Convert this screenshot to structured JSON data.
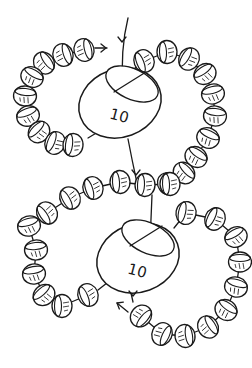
{
  "diagram": {
    "title": "",
    "background": "#ffffff",
    "line_color": "#1a1a1a",
    "big_beads": [
      {
        "label": "10",
        "cx": 120,
        "cy": 103,
        "rx": 42,
        "ry": 34,
        "rot": -20,
        "hole": {
          "cx": 132,
          "cy": 84,
          "rx": 28,
          "ry": 15,
          "rot": 25
        }
      },
      {
        "label": "10",
        "cx": 138,
        "cy": 258,
        "rx": 42,
        "ry": 34,
        "rot": -20,
        "hole": {
          "cx": 148,
          "cy": 238,
          "rx": 28,
          "ry": 15,
          "rot": 25
        }
      }
    ],
    "seed_bead_loops": [
      {
        "name": "upper-left-loop",
        "beads": [
          [
            84,
            50
          ],
          [
            63,
            55
          ],
          [
            44,
            63
          ],
          [
            32,
            77
          ],
          [
            25,
            96
          ],
          [
            28,
            116
          ],
          [
            39,
            132
          ],
          [
            55,
            143
          ],
          [
            73,
            145
          ]
        ]
      },
      {
        "name": "upper-right-loop",
        "beads": [
          [
            144,
            61
          ],
          [
            167,
            52
          ],
          [
            189,
            59
          ],
          [
            205,
            74
          ],
          [
            213,
            94
          ],
          [
            215,
            116
          ],
          [
            208,
            138
          ],
          [
            196,
            157
          ],
          [
            184,
            173
          ],
          [
            168,
            184
          ]
        ]
      },
      {
        "name": "middle-band",
        "beads": [
          [
            47,
            213
          ],
          [
            70,
            198
          ],
          [
            93,
            188
          ],
          [
            120,
            182
          ],
          [
            145,
            185
          ],
          [
            170,
            184
          ]
        ]
      },
      {
        "name": "lower-left-loop",
        "beads": [
          [
            29,
            226
          ],
          [
            36,
            250
          ],
          [
            34,
            274
          ],
          [
            44,
            295
          ],
          [
            62,
            306
          ],
          [
            88,
            295
          ]
        ]
      },
      {
        "name": "lower-right-loop",
        "beads": [
          [
            186,
            213
          ],
          [
            215,
            219
          ],
          [
            236,
            237
          ],
          [
            240,
            262
          ],
          [
            236,
            287
          ],
          [
            226,
            310
          ],
          [
            208,
            327
          ],
          [
            185,
            336
          ],
          [
            162,
            334
          ],
          [
            141,
            316
          ]
        ]
      }
    ],
    "threads": [
      {
        "name": "entry-thread",
        "d": "M128 18 Q120 50 123 91"
      },
      {
        "name": "exit-thread-top",
        "d": "M128 139 Q132 160 137 183"
      },
      {
        "name": "upper-left-tail",
        "d": "M95 48 L107 48"
      },
      {
        "name": "connector-top-left",
        "d": "M88 138 L98 132"
      },
      {
        "name": "connector-top-right",
        "d": "M144 61 L130 72"
      },
      {
        "name": "middle-down-thread",
        "d": "M152 195 L150 243"
      },
      {
        "name": "connector-lower-right",
        "d": "M174 228 L186 213"
      },
      {
        "name": "connector-lower-left",
        "d": "M98 290 L112 279"
      },
      {
        "name": "exit-thread-bottom",
        "d": "M133 302 L131 293"
      },
      {
        "name": "lower-tail",
        "d": "M128 312 L117 303"
      }
    ],
    "arrows": [
      {
        "name": "arrow-entry",
        "x": 122,
        "y": 42,
        "dir": "down"
      },
      {
        "name": "arrow-tail-upper",
        "x": 106,
        "y": 48,
        "dir": "right"
      },
      {
        "name": "arrow-mid",
        "x": 136,
        "y": 175,
        "dir": "down"
      },
      {
        "name": "arrow-lower",
        "x": 133,
        "y": 296,
        "dir": "down"
      },
      {
        "name": "arrow-lower-tail",
        "x": 117,
        "y": 303,
        "dir": "up-left"
      }
    ]
  }
}
